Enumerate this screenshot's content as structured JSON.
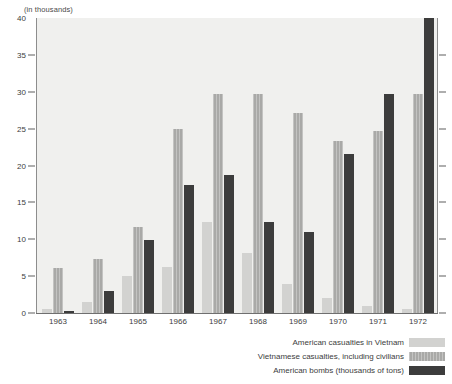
{
  "chart_data": {
    "type": "bar",
    "title": "",
    "subtitle": "",
    "xlabel": "",
    "ylabel": "(in thousands)",
    "ylim": [
      0,
      40
    ],
    "yticks": [
      0,
      5,
      10,
      15,
      20,
      25,
      30,
      35,
      40
    ],
    "grid": false,
    "legend_position": "bottom-right",
    "categories": [
      "1963",
      "1964",
      "1965",
      "1966",
      "1967",
      "1968",
      "1969",
      "1970",
      "1971",
      "1972"
    ],
    "series": [
      {
        "name": "American casualties in Vietnam",
        "color": "#d2d2d0",
        "values": [
          0.5,
          1.5,
          5.0,
          6.2,
          12.3,
          8.2,
          4.0,
          2.1,
          1.0,
          0.6
        ]
      },
      {
        "name": "Vietnamese casualties, including civilians",
        "color": "#a9a9a7",
        "values": [
          6.1,
          7.3,
          11.7,
          24.9,
          29.7,
          29.7,
          27.1,
          23.3,
          24.7,
          29.7
        ]
      },
      {
        "name": "American bombs (thousands of tons)",
        "color": "#3c3c3c",
        "values": [
          0.3,
          3.0,
          9.9,
          17.4,
          18.7,
          12.3,
          11.0,
          21.6,
          29.7,
          40.0
        ]
      }
    ]
  },
  "axis": {
    "caption": "(in thousands)"
  },
  "legend": {
    "items": [
      {
        "label": "American casualties in Vietnam",
        "swatch": "s0"
      },
      {
        "label": "Vietnamese casualties, including civilians",
        "swatch": "s1"
      },
      {
        "label": "American bombs (thousands of tons)",
        "swatch": "s2"
      }
    ]
  }
}
